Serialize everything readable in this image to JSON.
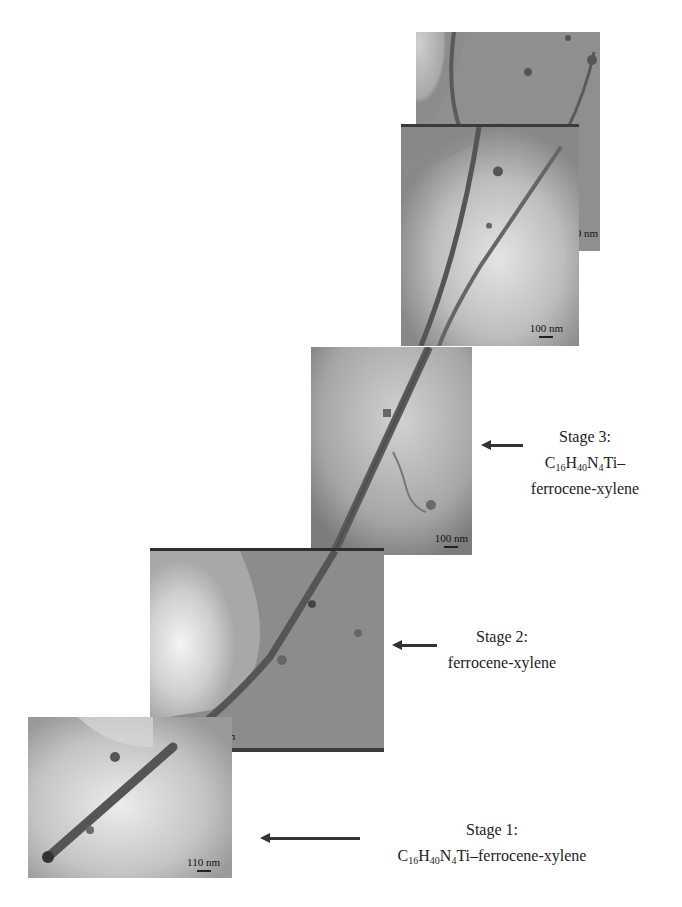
{
  "figure": {
    "panels": [
      {
        "id": "panel-1",
        "scale_bar": "110 nm"
      },
      {
        "id": "panel-2",
        "scale_bar": "100 nm"
      },
      {
        "id": "panel-3",
        "scale_bar": "100 nm"
      },
      {
        "id": "panel-4",
        "scale_bar": "100 nm"
      },
      {
        "id": "panel-5",
        "scale_bar": "100 nm"
      }
    ],
    "stages": [
      {
        "title": "Stage 1:",
        "formula": {
          "C": "C",
          "c_sub": "16",
          "H": "H",
          "h_sub": "40",
          "N": "N",
          "n_sub": "4",
          "rest": "Ti–ferrocene-xylene"
        }
      },
      {
        "title": "Stage 2:",
        "line2": "ferrocene-xylene"
      },
      {
        "title": "Stage 3:",
        "formula": {
          "C": "C",
          "c_sub": "16",
          "H": "H",
          "h_sub": "40",
          "N": "N",
          "n_sub": "4",
          "rest": "Ti–"
        },
        "line3": "ferrocene-xylene"
      }
    ],
    "colors": {
      "background": "#ffffff",
      "micrograph_dark": "#6e6e6e",
      "micrograph_mid": "#9a9a9a",
      "micrograph_light": "#e8e8e8",
      "nanotube": "#4a4a4a",
      "text": "#222222"
    }
  }
}
